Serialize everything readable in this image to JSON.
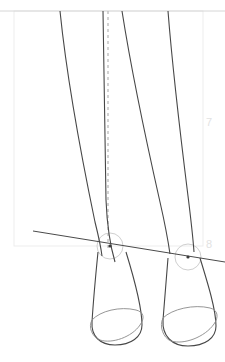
{
  "document": {
    "type": "figure-drawing-construction-study",
    "title": "Legs and feet construction study",
    "background_color": "#ffffff",
    "width": 225,
    "height": 362
  },
  "guides": {
    "numbers": [
      {
        "label": "7",
        "x": 206,
        "y": 117
      },
      {
        "label": "8",
        "x": 206,
        "y": 239
      }
    ],
    "number_color": "#e2e2e2",
    "frame_color": "#ededed",
    "frame": {
      "x": 14,
      "y": 11,
      "width": 189,
      "height": 235
    },
    "baseline_color": "#d6d6d6",
    "baseline": {
      "x1": 0,
      "y1": 11,
      "x2": 225,
      "y2": 11
    },
    "plumb_line": {
      "name": "dashed-plumb-line",
      "color": "#bfbfbf",
      "dash": "3 3",
      "x1": 108,
      "y1": 11,
      "x2": 108,
      "y2": 248
    },
    "ankle_axis_line": {
      "name": "ankle-axis-line",
      "color": "#4a4a4a",
      "x1": 33,
      "y1": 231,
      "x2": 225,
      "y2": 262
    }
  },
  "anatomy": {
    "stroke_color": "#474747",
    "light_stroke_color": "#8a8a8a",
    "circle_color": "#cfcfcf",
    "legs": [
      {
        "name": "left-leg-outer-contour",
        "path": "M 60 11 C 66 70, 80 150, 95 222 C 99 238, 101 248, 102 256"
      },
      {
        "name": "left-leg-inner-contour",
        "path": "M 103 11 C 104 70, 105 140, 106 200 C 107 225, 110 245, 115 262"
      },
      {
        "name": "right-leg-outer-contour",
        "path": "M 122 11 C 130 62, 146 140, 160 202 C 165 224, 168 240, 170 254"
      },
      {
        "name": "right-leg-inner-contour",
        "path": "M 168 11 C 172 62, 180 132, 188 196 C 191 220, 193 238, 194 252"
      }
    ],
    "ankles": [
      {
        "name": "left-ankle-joint",
        "cx": 110,
        "cy": 246,
        "r": 13
      },
      {
        "name": "right-ankle-joint",
        "cx": 188,
        "cy": 257,
        "r": 13
      }
    ],
    "feet": [
      {
        "name": "left-foot",
        "outline": "M 98 252 C 95 282, 93 306, 92 322 C 91 336, 100 345, 115 345 C 131 345, 142 337, 142 325 C 142 308, 134 278, 126 252",
        "sole_ellipse": "M 92 320 C 100 311, 120 306, 136 310 C 144 312, 145 318, 140 325 C 132 337, 112 344, 100 340 C 92 337, 88 327, 92 320"
      },
      {
        "name": "right-foot",
        "outline": "M 168 258 C 166 284, 164 306, 163 320 C 162 336, 172 346, 188 346 C 205 346, 216 338, 216 326 C 216 310, 208 284, 200 258",
        "sole_ellipse": "M 163 318 C 172 309, 194 304, 210 308 C 218 310, 219 317, 214 324 C 205 337, 184 345, 171 341 C 163 338, 159 326, 163 318"
      }
    ]
  }
}
